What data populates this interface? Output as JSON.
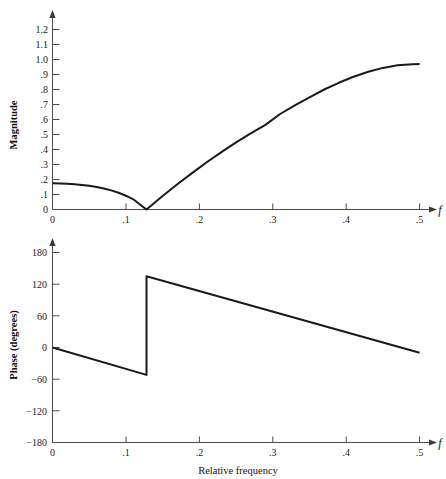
{
  "figure": {
    "name": "frequency-response-figure",
    "background": "#ffffff",
    "curve_color": "#1a1a1a",
    "axis_color": "#4a4a4a",
    "width": 446,
    "height": 479
  },
  "chart_data": [
    {
      "type": "line",
      "id": "magnitude-plot",
      "title": "",
      "xlabel": "f",
      "ylabel": "Magnitude",
      "xlim": [
        0,
        0.5
      ],
      "ylim": [
        0,
        1.2
      ],
      "grid": false,
      "legend": null,
      "xticks": [
        0,
        0.1,
        0.2,
        0.3,
        0.4,
        0.5
      ],
      "xticklabels": [
        "0",
        ".1",
        ".2",
        ".3",
        ".4",
        ".5"
      ],
      "yticks": [
        0,
        0.1,
        0.2,
        0.3,
        0.4,
        0.5,
        0.6,
        0.7,
        0.8,
        0.9,
        1.0,
        1.1,
        1.2
      ],
      "yticklabels": [
        "0",
        ".1",
        ".2",
        ".3",
        ".4",
        ".5",
        ".6",
        ".7",
        ".8",
        ".9",
        "1.0",
        "1.1",
        "1.2"
      ],
      "annotations": [
        "null at f = 0.128",
        "peak magnitude 0.97 at f = 0.5"
      ],
      "series": [
        {
          "name": "Magnitude",
          "x": [
            0.0,
            0.01,
            0.02,
            0.03,
            0.04,
            0.05,
            0.06,
            0.07,
            0.08,
            0.09,
            0.1,
            0.11,
            0.12,
            0.128,
            0.135,
            0.15,
            0.17,
            0.19,
            0.21,
            0.23,
            0.25,
            0.27,
            0.29,
            0.31,
            0.33,
            0.35,
            0.37,
            0.39,
            0.41,
            0.43,
            0.45,
            0.47,
            0.49,
            0.5
          ],
          "values": [
            0.175,
            0.174,
            0.172,
            0.169,
            0.164,
            0.158,
            0.15,
            0.14,
            0.127,
            0.111,
            0.092,
            0.068,
            0.03,
            0.0,
            0.028,
            0.09,
            0.168,
            0.243,
            0.315,
            0.383,
            0.447,
            0.507,
            0.564,
            0.637,
            0.695,
            0.748,
            0.8,
            0.845,
            0.885,
            0.918,
            0.944,
            0.961,
            0.969,
            0.97
          ]
        }
      ]
    },
    {
      "type": "line",
      "id": "phase-plot",
      "title": "",
      "xlabel": "f",
      "ylabel": "Phase (degrees)",
      "xaxis_caption": "Relative frequency",
      "xlim": [
        0,
        0.5
      ],
      "ylim": [
        -180,
        180
      ],
      "grid": false,
      "legend": null,
      "xticks": [
        0,
        0.1,
        0.2,
        0.3,
        0.4,
        0.5
      ],
      "xticklabels": [
        "0",
        ".1",
        ".2",
        ".3",
        ".4",
        ".5"
      ],
      "yticks": [
        -180,
        -120,
        -60,
        0,
        60,
        120,
        180
      ],
      "yticklabels": [
        "−180",
        "−120",
        "−60",
        "0",
        "60",
        "120",
        "180"
      ],
      "annotations": [
        "phase discontinuity of 187° at f = 0.128"
      ],
      "series": [
        {
          "name": "Phase",
          "x": [
            0.0,
            0.128,
            0.128,
            0.5
          ],
          "values": [
            0,
            -52,
            135,
            -10
          ],
          "discontinuity_at": 0.128
        }
      ]
    }
  ],
  "labels": {
    "magnitude_axis_title": "Magnitude",
    "phase_axis_title": "Phase (degrees)",
    "frequency_symbol": "f",
    "relative_frequency": "Relative frequency"
  }
}
